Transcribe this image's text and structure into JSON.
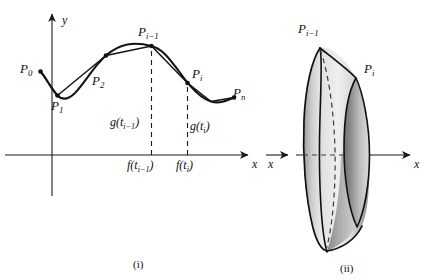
{
  "figure": {
    "captions": [
      {
        "id": "caption-left",
        "text": "(i)"
      },
      {
        "id": "caption-right",
        "text": "(ii)"
      }
    ]
  },
  "left_panel": {
    "axes": {
      "x_label": "x",
      "y_label": "y"
    },
    "point_labels": [
      {
        "id": "P0",
        "base": "P",
        "sub": "0"
      },
      {
        "id": "P1",
        "base": "P",
        "sub": "1"
      },
      {
        "id": "P2",
        "base": "P",
        "sub": "2"
      },
      {
        "id": "Pi-1",
        "base": "P",
        "sub": "i−1"
      },
      {
        "id": "Pi",
        "base": "P",
        "sub": "i"
      },
      {
        "id": "Pn",
        "base": "P",
        "sub": "n"
      }
    ],
    "value_labels": [
      {
        "id": "g-t-i-1",
        "base": "g(t",
        "sub": "i−1",
        "tail": ")"
      },
      {
        "id": "g-t-i",
        "base": "g(t",
        "sub": "i",
        "tail": ")"
      },
      {
        "id": "f-t-i-1",
        "base": "f(t",
        "sub": "i−1",
        "tail": ")"
      },
      {
        "id": "f-t-i",
        "base": "f(t",
        "sub": "i",
        "tail": ")"
      }
    ]
  },
  "right_panel": {
    "axes": {
      "x_label_left": "x",
      "x_label_right": "x"
    },
    "point_labels": [
      {
        "id": "Pi-1",
        "base": "P",
        "sub": "i−1"
      },
      {
        "id": "Pi",
        "base": "P",
        "sub": "i"
      }
    ]
  },
  "colors": {
    "ink": "#111111",
    "axis": "#222222",
    "curve": "#111111",
    "background": "#ffffff",
    "shade_light": "#e8e8e8",
    "shade_mid": "#bdbdbd",
    "shade_dark": "#8f8f8f"
  }
}
